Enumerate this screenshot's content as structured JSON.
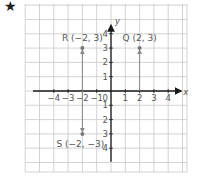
{
  "header": {
    "marker_icon": "star-icon",
    "marker_glyph": "★"
  },
  "chart_data": {
    "type": "scatter",
    "title": "",
    "xlabel": "x",
    "ylabel": "y",
    "xlim": [
      -6,
      5
    ],
    "ylim": [
      -5.7,
      6
    ],
    "grid": true,
    "x_ticks": [
      "−4",
      "−3",
      "−2",
      "−1",
      "1",
      "2",
      "3",
      "4"
    ],
    "y_ticks": [
      "4",
      "3",
      "2",
      "1",
      "1",
      "2",
      "3",
      "4"
    ],
    "origin_label": "0",
    "points": [
      {
        "name": "R",
        "label": "R (−2, 3)",
        "x": -2,
        "y": 3
      },
      {
        "name": "Q",
        "label": "Q (2, 3)",
        "x": 2,
        "y": 3
      },
      {
        "name": "S",
        "label": "S (−2, −3)",
        "x": -2,
        "y": -3
      }
    ],
    "arrows": [
      {
        "from": [
          -2,
          0
        ],
        "to": [
          -2,
          3
        ]
      },
      {
        "from": [
          2,
          0
        ],
        "to": [
          2,
          3
        ]
      },
      {
        "from": [
          -2,
          0
        ],
        "to": [
          -2,
          -3
        ]
      }
    ]
  },
  "colors": {
    "grid": "#c8c8c8",
    "axis": "#1a1a1a",
    "point": "#777777",
    "text": "#555555"
  }
}
